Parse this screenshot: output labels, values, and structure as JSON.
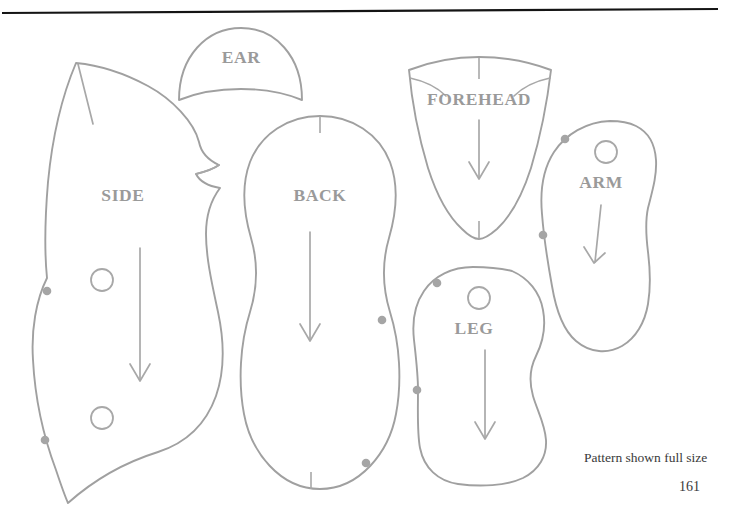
{
  "document": {
    "caption": "Pattern shown full size",
    "page_number": "161",
    "rule_color": "#141414",
    "line_color": "#a0a0a0",
    "label_color": "#9a9a9a",
    "background": "#ffffff"
  },
  "pattern": {
    "title_pieces": 6,
    "pieces": [
      {
        "id": "side",
        "label": "SIDE",
        "label_x": 123,
        "label_y": 197,
        "holes": 2,
        "match_dots": 2,
        "arrow": true,
        "notches": 0
      },
      {
        "id": "ear",
        "label": "EAR",
        "label_x": 241,
        "label_y": 59,
        "holes": 0,
        "match_dots": 0,
        "arrow": false,
        "notches": 0
      },
      {
        "id": "back",
        "label": "BACK",
        "label_x": 320,
        "label_y": 197,
        "holes": 0,
        "match_dots": 2,
        "arrow": true,
        "notches": 2
      },
      {
        "id": "forehead",
        "label": "FOREHEAD",
        "label_x": 479,
        "label_y": 101,
        "holes": 0,
        "match_dots": 0,
        "arrow": true,
        "notches": 2
      },
      {
        "id": "arm",
        "label": "ARM",
        "label_x": 601,
        "label_y": 184,
        "holes": 1,
        "match_dots": 2,
        "arrow": true,
        "notches": 0
      },
      {
        "id": "leg",
        "label": "LEG",
        "label_x": 474,
        "label_y": 330,
        "holes": 1,
        "match_dots": 2,
        "arrow": true,
        "notches": 0
      }
    ]
  }
}
